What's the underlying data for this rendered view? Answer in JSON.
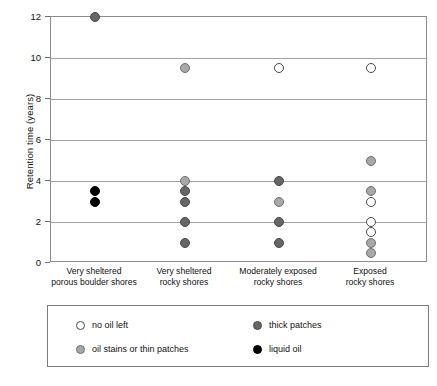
{
  "chart_data": {
    "type": "scatter",
    "title": "",
    "xlabel": "",
    "ylabel": "Retention time (years)",
    "ylim": [
      0,
      12
    ],
    "yticks": [
      0,
      2,
      4,
      6,
      8,
      10,
      12
    ],
    "grid": true,
    "legend_position": "below-axes",
    "categories": [
      "Very sheltered\nporous boulder shores",
      "Very sheltered\nrocky shores",
      "Moderately exposed\nrocky shores",
      "Exposed\nrocky shores"
    ],
    "category_lines": [
      [
        "Very sheltered",
        "porous boulder shores"
      ],
      [
        "Very sheltered",
        "rocky shores"
      ],
      [
        "Moderately exposed",
        "rocky shores"
      ],
      [
        "Exposed",
        "rocky shores"
      ]
    ],
    "legend_entries": [
      {
        "key": "white",
        "label": "no oil left",
        "color": "#ffffff"
      },
      {
        "key": "dark",
        "label": "thick patches",
        "color": "#666666"
      },
      {
        "key": "light",
        "label": "oil stains or thin patches",
        "color": "#a8a8a8"
      },
      {
        "key": "black",
        "label": "liquid oil",
        "color": "#000000"
      }
    ],
    "series": [
      {
        "name": "no oil left",
        "key": "white",
        "points": [
          {
            "category": 2,
            "y": 9.5
          },
          {
            "category": 3,
            "y": 9.5
          },
          {
            "category": 3,
            "y": 3.0
          },
          {
            "category": 3,
            "y": 2.0
          },
          {
            "category": 3,
            "y": 1.5
          }
        ]
      },
      {
        "name": "oil stains or thin patches",
        "key": "light",
        "points": [
          {
            "category": 1,
            "y": 9.5
          },
          {
            "category": 1,
            "y": 4.0
          },
          {
            "category": 2,
            "y": 3.0
          },
          {
            "category": 3,
            "y": 5.0
          },
          {
            "category": 3,
            "y": 3.5
          },
          {
            "category": 3,
            "y": 1.0
          },
          {
            "category": 3,
            "y": 0.5
          }
        ]
      },
      {
        "name": "thick patches",
        "key": "dark",
        "points": [
          {
            "category": 0,
            "y": 12.0
          },
          {
            "category": 1,
            "y": 3.5
          },
          {
            "category": 1,
            "y": 3.0
          },
          {
            "category": 1,
            "y": 2.0
          },
          {
            "category": 1,
            "y": 1.0
          },
          {
            "category": 2,
            "y": 4.0
          },
          {
            "category": 2,
            "y": 2.0
          },
          {
            "category": 2,
            "y": 1.0
          }
        ]
      },
      {
        "name": "liquid oil",
        "key": "black",
        "points": [
          {
            "category": 0,
            "y": 3.5
          },
          {
            "category": 0,
            "y": 3.0
          }
        ]
      }
    ]
  }
}
